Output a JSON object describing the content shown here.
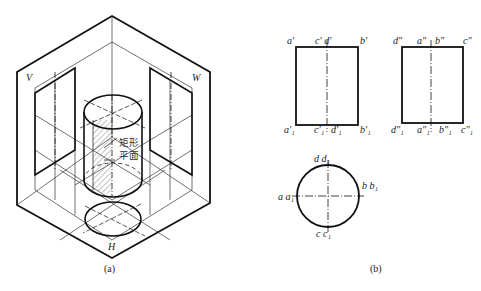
{
  "figure_a": {
    "caption": "(a)",
    "plane_labels": {
      "v": "V",
      "w": "W",
      "h": "H"
    },
    "annotation": {
      "line1": "矩形",
      "line2": "平面"
    }
  },
  "figure_b": {
    "caption": "(b)",
    "front_view": {
      "top": {
        "a": "a′",
        "cd": "c′  d′",
        "b": "b′"
      },
      "bottom": {
        "a1": "a′₁",
        "c1": "c′₁",
        "d1": "d′₁",
        "b1": "b′₁"
      }
    },
    "side_view": {
      "top": {
        "d": "d″",
        "a": "a″",
        "b": "b″",
        "c": "c″"
      },
      "bottom": {
        "d1": "d″₁",
        "a1": "a″₁",
        "b1": "b″₁",
        "c1": "c″₁"
      }
    },
    "top_view": {
      "top": "d  d₁",
      "left": "a a₁",
      "right": "b b₁",
      "bottom": "c  c₁"
    }
  },
  "colors": {
    "line": "#111111",
    "thin": "#333333",
    "hatch": "#555555"
  }
}
